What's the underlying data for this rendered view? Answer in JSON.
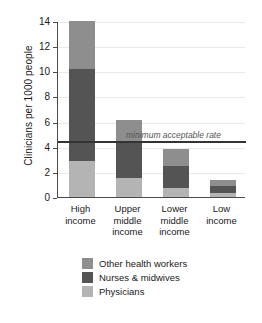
{
  "chart_data": {
    "type": "bar",
    "subtype": "stacked",
    "title": "",
    "xlabel": "",
    "ylabel": "Clinicians per 1000 people",
    "ylim": [
      0,
      14
    ],
    "yticks": [
      0,
      2,
      4,
      6,
      8,
      10,
      12,
      14
    ],
    "ytick_labels": [
      "0",
      "2",
      "4",
      "6",
      "8",
      "10",
      "12",
      "14"
    ],
    "grid": true,
    "legend_position": "bottom",
    "categories": [
      "High income",
      "Upper middle income",
      "Lower middle income",
      "Low income"
    ],
    "category_lines": [
      [
        "High",
        "income"
      ],
      [
        "Upper",
        "middle",
        "income"
      ],
      [
        "Lower",
        "middle",
        "income"
      ],
      [
        "Low",
        "income"
      ]
    ],
    "series": [
      {
        "name": "Physicians",
        "color": "#b4b4b4",
        "values": [
          2.9,
          1.55,
          0.75,
          0.35
        ]
      },
      {
        "name": "Nurses & midwives",
        "color": "#545454",
        "values": [
          7.3,
          2.75,
          1.75,
          0.5
        ]
      },
      {
        "name": "Other health workers",
        "color": "#8e8e8e",
        "values": [
          3.8,
          1.8,
          1.35,
          0.5
        ]
      }
    ],
    "totals": [
      14.0,
      6.1,
      3.85,
      1.35
    ],
    "annotations": [
      {
        "type": "hline",
        "value": 4.5,
        "label": "minimum acceptable rate",
        "color": "#333333"
      }
    ]
  },
  "legend": {
    "items": [
      {
        "label": "Other health workers",
        "color": "#8e8e8e"
      },
      {
        "label": "Nurses & midwives",
        "color": "#545454"
      },
      {
        "label": "Physicians",
        "color": "#b4b4b4"
      }
    ]
  }
}
